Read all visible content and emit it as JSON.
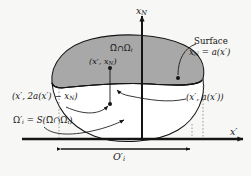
{
  "figure": {
    "background_color": "#f7f7f5",
    "ink_color": "#141414",
    "shaded_fill": "#a8a8a8",
    "unshaded_fill": "#ffffff"
  },
  "axes": {
    "vertical_label": "x",
    "vertical_sub": "N",
    "horizontal_label": "x",
    "horizontal_prime": "′"
  },
  "labels": {
    "region": {
      "omega_tilde": "Ω",
      "tilde": "~",
      "intersect": "∩",
      "omega": "Ω",
      "sub": "i"
    },
    "surface_word": "Surface",
    "surface_eq_lhs": "x",
    "surface_eq_lhs_sub": "N",
    "surface_eq_rhs": "= a(x′)",
    "point_top": "(x′, x",
    "point_top_sub": "N",
    "point_top_end": ")",
    "point_reflected": "(x′, 2a(x′) − x",
    "point_reflected_sub": "N",
    "point_reflected_end": ")",
    "point_surface": "(x′, a(x′))",
    "omega_prime_lhs": "Ω",
    "omega_prime_mark": "′",
    "omega_prime_sub": "i",
    "omega_prime_rhs": "= S(",
    "omega_prime_tail": ")",
    "interval_label": "O",
    "interval_prime": "′",
    "interval_sub": "i"
  },
  "geometry": {
    "origin_x": 142,
    "origin_y": 139,
    "interval_left_x": 59,
    "interval_right_x": 192,
    "surface_left_x": 52,
    "surface_right_x": 203,
    "surface_y": 81,
    "point_top_y": 68,
    "point_reflected_y": 104,
    "point_surface_x": 178,
    "point_surface_y": 78
  }
}
